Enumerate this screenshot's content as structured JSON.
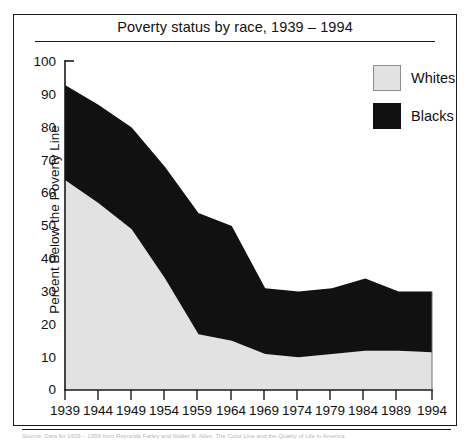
{
  "chart_data": {
    "type": "area",
    "title": "Poverty status by race, 1939 – 1994",
    "xlabel": "",
    "ylabel": "Percent Below the Poverty Line",
    "ylim": [
      0,
      100
    ],
    "ytick_labels": [
      "100",
      "90",
      "80",
      "70",
      "60",
      "50",
      "40",
      "30",
      "20",
      "10",
      "0"
    ],
    "ytick_values": [
      100,
      90,
      80,
      70,
      60,
      50,
      40,
      30,
      20,
      10,
      0
    ],
    "categories": [
      "1939",
      "1944",
      "1949",
      "1954",
      "1959",
      "1964",
      "1969",
      "1974",
      "1979",
      "1984",
      "1989",
      "1994"
    ],
    "x": [
      1939,
      1944,
      1949,
      1954,
      1959,
      1964,
      1969,
      1974,
      1979,
      1984,
      1989,
      1994
    ],
    "stacked": true,
    "grid": false,
    "legend_position": "top-right",
    "series": [
      {
        "name": "Whites",
        "color": "#e2e2e2",
        "values": [
          64,
          57,
          49,
          34,
          17,
          15,
          11,
          10,
          11,
          12,
          12,
          11.5
        ]
      },
      {
        "name": "Blacks",
        "color": "#111111",
        "values": [
          93,
          87,
          80,
          68,
          54,
          50,
          31,
          30,
          31,
          34,
          30,
          30
        ]
      }
    ],
    "series_note": "Blacks values are the cumulative top of the stacked band; Whites values are the lower band top."
  },
  "legend": {
    "entries": [
      {
        "label": "Whites",
        "swatch": "light-gray-square"
      },
      {
        "label": "Blacks",
        "swatch": "black-square"
      }
    ]
  },
  "caption": {
    "text": "Source: Data for 1939 – 1959 from Reynolds Farley and Walter R. Allen, The Color Line and the Quality of Life in America"
  },
  "colors": {
    "whites": "#e2e2e2",
    "blacks": "#111111",
    "axis": "#1a1a1a",
    "text": "#111111"
  }
}
